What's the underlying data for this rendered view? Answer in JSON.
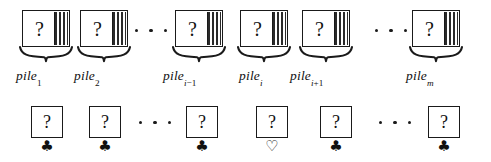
{
  "figure": {
    "caption_symbols": {
      "question_mark": "?",
      "club": "♣",
      "heart_outline": "♡"
    },
    "ellipsis_glyph": "···"
  },
  "piles": [
    {
      "id": "pile-1",
      "card_face": "?",
      "label_base": "pile",
      "label_sub": "1",
      "label_sub_italic": ""
    },
    {
      "id": "pile-2",
      "card_face": "?",
      "label_base": "pile",
      "label_sub": "2",
      "label_sub_italic": ""
    },
    {
      "id": "pile-i-1",
      "card_face": "?",
      "label_base": "pile",
      "label_sub": "−1",
      "label_sub_italic": "i"
    },
    {
      "id": "pile-i",
      "card_face": "?",
      "label_base": "pile",
      "label_sub": "",
      "label_sub_italic": "i"
    },
    {
      "id": "pile-i+1",
      "card_face": "?",
      "label_base": "pile",
      "label_sub": "+1",
      "label_sub_italic": "i"
    },
    {
      "id": "pile-m",
      "card_face": "?",
      "label_base": "pile",
      "label_sub": "",
      "label_sub_italic": "m"
    }
  ],
  "cards": [
    {
      "id": "card-1",
      "face": "?",
      "suit": "♣",
      "suit_name": "club-filled",
      "filled": true
    },
    {
      "id": "card-2",
      "face": "?",
      "suit": "♣",
      "suit_name": "club-filled",
      "filled": true
    },
    {
      "id": "card-i-1",
      "face": "?",
      "suit": "♣",
      "suit_name": "club-filled",
      "filled": true
    },
    {
      "id": "card-i",
      "face": "?",
      "suit": "♡",
      "suit_name": "heart-outline",
      "filled": false
    },
    {
      "id": "card-i+1",
      "face": "?",
      "suit": "♣",
      "suit_name": "club-filled",
      "filled": true
    },
    {
      "id": "card-m",
      "face": "?",
      "suit": "♣",
      "suit_name": "club-filled",
      "filled": true
    }
  ],
  "colors": {
    "ink": "#101010",
    "paper": "#ffffff"
  }
}
